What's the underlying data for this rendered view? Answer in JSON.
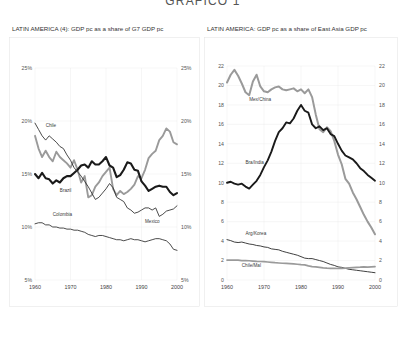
{
  "page": {
    "title": "GRAFICO 1"
  },
  "charts": [
    {
      "id": "left",
      "header": "LATIN AMERICA (4): GDP pc as a share of G7 GDP pc",
      "chart_data": {
        "type": "line",
        "title": "LATIN AMERICA (4): GDP pc as a share of G7 GDP pc",
        "xlabel": "",
        "ylabel": "",
        "xlim": [
          1960,
          2000
        ],
        "ylim": [
          5,
          25
        ],
        "ytick_labels": [
          "5%",
          "10%",
          "15%",
          "20%",
          "25%"
        ],
        "ytick_values": [
          5,
          10,
          15,
          20,
          25
        ],
        "xtick_labels": [
          "1960",
          "1970",
          "1980",
          "1990",
          "2000"
        ],
        "xtick_values": [
          1960,
          1970,
          1980,
          1990,
          2000
        ],
        "grid": true,
        "legend_position": "inline-annotations",
        "series": [
          {
            "name": "Chile",
            "color": "#9a9a9a",
            "width": 1.9,
            "x": [
              1960,
              1961,
              1962,
              1963,
              1964,
              1965,
              1966,
              1967,
              1968,
              1969,
              1970,
              1971,
              1972,
              1973,
              1974,
              1975,
              1976,
              1977,
              1978,
              1979,
              1980,
              1981,
              1982,
              1983,
              1984,
              1985,
              1986,
              1987,
              1988,
              1989,
              1990,
              1991,
              1992,
              1993,
              1994,
              1995,
              1996,
              1997,
              1998,
              1999,
              2000
            ],
            "values": [
              18.6,
              17.4,
              16.6,
              17.2,
              16.6,
              16.2,
              17.1,
              16.6,
              16.3,
              16.0,
              15.6,
              16.3,
              15.4,
              14.2,
              14.8,
              12.8,
              13.0,
              13.8,
              14.2,
              14.8,
              15.2,
              15.6,
              13.6,
              13.0,
              13.4,
              13.1,
              13.3,
              13.6,
              14.0,
              14.8,
              14.6,
              15.4,
              16.5,
              16.9,
              17.2,
              18.2,
              18.6,
              19.3,
              19.0,
              18.0,
              17.8
            ]
          },
          {
            "name": "Brazil",
            "color": "#1a1a1a",
            "width": 2.1,
            "x": [
              1960,
              1961,
              1962,
              1963,
              1964,
              1965,
              1966,
              1967,
              1968,
              1969,
              1970,
              1971,
              1972,
              1973,
              1974,
              1975,
              1976,
              1977,
              1978,
              1979,
              1980,
              1981,
              1982,
              1983,
              1984,
              1985,
              1986,
              1987,
              1988,
              1989,
              1990,
              1991,
              1992,
              1993,
              1994,
              1995,
              1996,
              1997,
              1998,
              1999,
              2000
            ],
            "values": [
              15.0,
              14.6,
              15.1,
              14.6,
              14.5,
              14.1,
              14.4,
              14.2,
              14.6,
              14.8,
              14.8,
              15.1,
              15.4,
              15.8,
              15.9,
              15.6,
              16.2,
              15.9,
              15.9,
              16.2,
              16.6,
              15.8,
              15.6,
              14.7,
              14.9,
              15.4,
              16.1,
              16.0,
              15.4,
              15.3,
              14.3,
              13.9,
              13.4,
              13.6,
              13.8,
              13.9,
              13.8,
              13.8,
              13.3,
              13.0,
              13.2
            ]
          },
          {
            "name": "Colombia",
            "color": "#2a2a2a",
            "width": 0.85,
            "x": [
              1960,
              1961,
              1962,
              1963,
              1964,
              1965,
              1966,
              1967,
              1968,
              1969,
              1970,
              1971,
              1972,
              1973,
              1974,
              1975,
              1976,
              1977,
              1978,
              1979,
              1980,
              1981,
              1982,
              1983,
              1984,
              1985,
              1986,
              1987,
              1988,
              1989,
              1990,
              1991,
              1992,
              1993,
              1994,
              1995,
              1996,
              1997,
              1998,
              1999,
              2000
            ],
            "values": [
              10.3,
              10.4,
              10.4,
              10.2,
              10.2,
              10.0,
              10.0,
              9.9,
              9.9,
              9.8,
              9.8,
              9.7,
              9.7,
              9.6,
              9.5,
              9.3,
              9.2,
              9.1,
              9.2,
              9.2,
              9.1,
              9.0,
              8.9,
              8.8,
              8.8,
              8.7,
              8.8,
              8.9,
              8.8,
              8.8,
              8.7,
              8.6,
              8.7,
              8.8,
              8.9,
              8.9,
              8.8,
              8.7,
              8.4,
              7.9,
              7.8
            ]
          },
          {
            "name": "Mexico",
            "color": "#2a2a2a",
            "width": 0.85,
            "x": [
              1960,
              1961,
              1962,
              1963,
              1964,
              1965,
              1966,
              1967,
              1968,
              1969,
              1970,
              1971,
              1972,
              1973,
              1974,
              1975,
              1976,
              1977,
              1978,
              1979,
              1980,
              1981,
              1982,
              1983,
              1984,
              1985,
              1986,
              1987,
              1988,
              1989,
              1990,
              1991,
              1992,
              1993,
              1994,
              1995,
              1996,
              1997,
              1998,
              1999,
              2000
            ],
            "values": [
              19.8,
              19.2,
              18.6,
              18.2,
              18.6,
              18.3,
              18.0,
              17.6,
              17.4,
              16.8,
              16.3,
              15.6,
              15.2,
              14.8,
              14.3,
              13.8,
              13.2,
              12.6,
              12.8,
              13.2,
              13.6,
              14.1,
              13.7,
              12.8,
              12.6,
              12.4,
              11.8,
              11.6,
              11.3,
              11.4,
              11.6,
              11.8,
              11.8,
              11.6,
              11.8,
              11.0,
              11.2,
              11.5,
              11.6,
              11.7,
              12.0
            ]
          }
        ],
        "annotations": [
          {
            "text": "Chile",
            "x": 1963,
            "y": 19.4
          },
          {
            "text": "Brazil",
            "x": 1967,
            "y": 13.3
          },
          {
            "text": "Colombia",
            "x": 1965,
            "y": 11.0
          },
          {
            "text": "Mexico",
            "x": 1991,
            "y": 10.4
          }
        ]
      }
    },
    {
      "id": "right",
      "header": "LATIN AMERICA: GDP pc as a share of East Asia GDP pc",
      "chart_data": {
        "type": "line",
        "title": "LATIN AMERICA: GDP pc as a share of East Asia GDP pc",
        "xlabel": "",
        "ylabel": "",
        "xlim": [
          1960,
          2000
        ],
        "ylim": [
          0,
          22
        ],
        "ytick_labels": [
          "0",
          "2",
          "4",
          "6",
          "8",
          "10",
          "12",
          "14",
          "16",
          "18",
          "20",
          "22"
        ],
        "ytick_values": [
          0,
          2,
          4,
          6,
          8,
          10,
          12,
          14,
          16,
          18,
          20,
          22
        ],
        "xtick_labels": [
          "1960",
          "1970",
          "1980",
          "1990",
          "2000"
        ],
        "xtick_values": [
          1960,
          1970,
          1980,
          1990,
          2000
        ],
        "grid": true,
        "legend_position": "inline-annotations",
        "series": [
          {
            "name": "Mex/China",
            "color": "#9a9a9a",
            "width": 2.0,
            "x": [
              1960,
              1961,
              1962,
              1963,
              1964,
              1965,
              1966,
              1967,
              1968,
              1969,
              1970,
              1971,
              1972,
              1973,
              1974,
              1975,
              1976,
              1977,
              1978,
              1979,
              1980,
              1981,
              1982,
              1983,
              1984,
              1985,
              1986,
              1987,
              1988,
              1989,
              1990,
              1991,
              1992,
              1993,
              1994,
              1995,
              1996,
              1997,
              1998,
              1999,
              2000
            ],
            "values": [
              20.3,
              21.1,
              21.6,
              21.0,
              20.2,
              19.3,
              19.0,
              20.4,
              21.1,
              19.9,
              19.4,
              19.3,
              19.6,
              19.8,
              19.9,
              19.6,
              19.5,
              19.6,
              19.7,
              19.4,
              19.6,
              19.2,
              19.6,
              18.8,
              17.0,
              15.5,
              15.2,
              15.7,
              15.3,
              14.3,
              12.9,
              11.9,
              10.4,
              9.9,
              9.0,
              8.3,
              7.5,
              6.7,
              6.0,
              5.4,
              4.7
            ]
          },
          {
            "name": "Bra/India",
            "color": "#1a1a1a",
            "width": 1.9,
            "x": [
              1960,
              1961,
              1962,
              1963,
              1964,
              1965,
              1966,
              1967,
              1968,
              1969,
              1970,
              1971,
              1972,
              1973,
              1974,
              1975,
              1976,
              1977,
              1978,
              1979,
              1980,
              1981,
              1982,
              1983,
              1984,
              1985,
              1986,
              1987,
              1988,
              1989,
              1990,
              1991,
              1992,
              1993,
              1994,
              1995,
              1996,
              1997,
              1998,
              1999,
              2000
            ],
            "values": [
              10.0,
              10.1,
              9.9,
              9.8,
              9.9,
              9.6,
              9.4,
              9.8,
              10.2,
              10.8,
              11.6,
              12.3,
              13.2,
              14.3,
              15.2,
              15.6,
              16.2,
              16.1,
              16.6,
              17.4,
              18.0,
              17.4,
              17.2,
              16.0,
              15.6,
              15.8,
              15.4,
              15.6,
              15.0,
              14.8,
              14.0,
              13.3,
              12.8,
              12.6,
              12.4,
              12.0,
              11.5,
              11.2,
              10.8,
              10.5,
              10.2
            ]
          },
          {
            "name": "Arg/Korea",
            "color": "#2a2a2a",
            "width": 0.9,
            "x": [
              1960,
              1961,
              1962,
              1963,
              1964,
              1965,
              1966,
              1967,
              1968,
              1969,
              1970,
              1971,
              1972,
              1973,
              1974,
              1975,
              1976,
              1977,
              1978,
              1979,
              1980,
              1981,
              1982,
              1983,
              1984,
              1985,
              1986,
              1987,
              1988,
              1989,
              1990,
              1991,
              1992,
              1993,
              1994,
              1995,
              1996,
              1997,
              1998,
              1999,
              2000
            ],
            "values": [
              4.15,
              4.05,
              3.9,
              3.85,
              3.9,
              3.8,
              3.7,
              3.65,
              3.55,
              3.5,
              3.4,
              3.35,
              3.2,
              3.15,
              3.1,
              2.95,
              2.85,
              2.75,
              2.65,
              2.55,
              2.4,
              2.25,
              2.2,
              2.2,
              2.1,
              2.0,
              1.9,
              1.75,
              1.6,
              1.5,
              1.35,
              1.3,
              1.2,
              1.1,
              1.05,
              1.0,
              0.95,
              0.9,
              0.85,
              0.8,
              0.75
            ]
          },
          {
            "name": "Chile/Mal",
            "color": "#9a9a9a",
            "width": 1.7,
            "x": [
              1960,
              1961,
              1962,
              1963,
              1964,
              1965,
              1966,
              1967,
              1968,
              1969,
              1970,
              1971,
              1972,
              1973,
              1974,
              1975,
              1976,
              1977,
              1978,
              1979,
              1980,
              1981,
              1982,
              1983,
              1984,
              1985,
              1986,
              1987,
              1988,
              1989,
              1990,
              1991,
              1992,
              1993,
              1994,
              1995,
              1996,
              1997,
              1998,
              1999,
              2000
            ],
            "values": [
              2.05,
              2.05,
              2.05,
              2.05,
              2.0,
              2.0,
              1.98,
              1.95,
              1.92,
              1.9,
              1.88,
              1.85,
              1.82,
              1.78,
              1.75,
              1.72,
              1.7,
              1.68,
              1.65,
              1.62,
              1.58,
              1.55,
              1.45,
              1.38,
              1.35,
              1.3,
              1.25,
              1.22,
              1.2,
              1.2,
              1.18,
              1.2,
              1.22,
              1.25,
              1.28,
              1.3,
              1.32,
              1.35,
              1.32,
              1.35,
              1.38
            ]
          }
        ],
        "annotations": [
          {
            "text": "Mex/China",
            "x": 1966,
            "y": 18.4
          },
          {
            "text": "Bra/India",
            "x": 1965,
            "y": 11.9
          },
          {
            "text": "Arg/Korea",
            "x": 1965,
            "y": 4.65
          },
          {
            "text": "Chile/Mal",
            "x": 1964,
            "y": 1.35
          }
        ]
      }
    }
  ]
}
